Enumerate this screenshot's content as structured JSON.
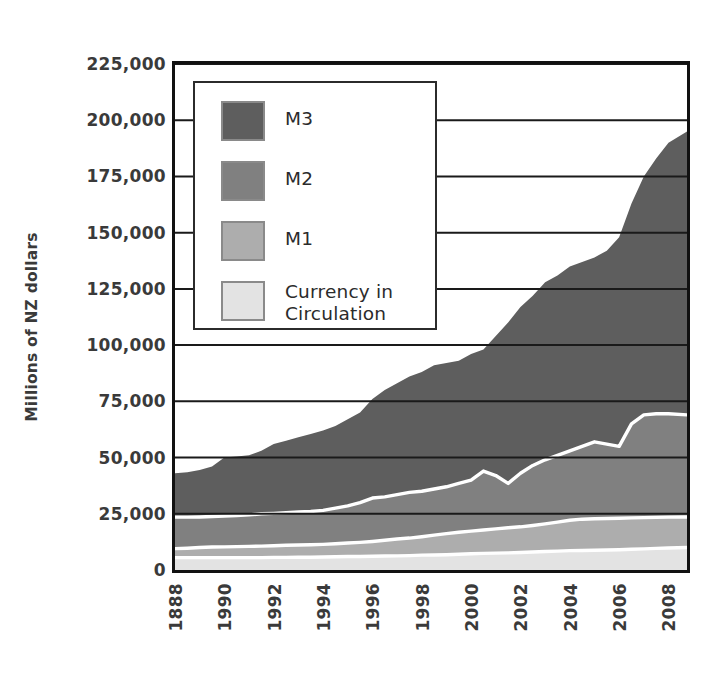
{
  "chart_data": {
    "type": "area",
    "title": "",
    "subtitle": "",
    "xlabel": "",
    "ylabel": "Millions of NZ dollars",
    "ylim": [
      0,
      225000
    ],
    "ytick_labels": [
      "225,000",
      "200,000",
      "175,000",
      "150,000",
      "125,000",
      "100,000",
      "75,000",
      "50,000",
      "25,000",
      "0"
    ],
    "ytick_values": [
      225000,
      200000,
      175000,
      150000,
      125000,
      100000,
      75000,
      50000,
      25000,
      0
    ],
    "ytick_step": 25000,
    "grid": true,
    "grid_axis": "y",
    "legend_position": "upper-left-inside",
    "stacking": "cumulative-overlay",
    "xtick_labels": [
      "1888",
      "1990",
      "1992",
      "1994",
      "1996",
      "1998",
      "2000",
      "2002",
      "2004",
      "2006",
      "2008"
    ],
    "xtick_values": [
      1988,
      1990,
      1992,
      1994,
      1996,
      1998,
      2000,
      2002,
      2004,
      2006,
      2008
    ],
    "x_range": [
      1988,
      2008.75
    ],
    "x_note": "First tick printed as 1888 in the source image; data begins 1988.",
    "series": [
      {
        "name": "M3",
        "color": "#5e5e5e",
        "x": [
          1988,
          1988.5,
          1989,
          1989.5,
          1990,
          1990.5,
          1991,
          1991.5,
          1992,
          1992.5,
          1993,
          1993.5,
          1994,
          1994.5,
          1995,
          1995.5,
          1996,
          1996.5,
          1997,
          1997.5,
          1998,
          1998.5,
          1999,
          1999.5,
          2000,
          2000.5,
          2001,
          2001.5,
          2002,
          2002.5,
          2003,
          2003.5,
          2004,
          2004.5,
          2005,
          2005.5,
          2006,
          2006.5,
          2007,
          2007.5,
          2008,
          2008.75
        ],
        "values": [
          43000,
          43500,
          44500,
          46000,
          50000,
          50500,
          51000,
          53000,
          56000,
          57500,
          59000,
          60500,
          62000,
          64000,
          67000,
          70000,
          76000,
          80000,
          83000,
          86000,
          88000,
          91000,
          92000,
          93000,
          96000,
          98000,
          104000,
          110000,
          117000,
          122000,
          128000,
          131000,
          135000,
          137000,
          139000,
          142000,
          148000,
          163000,
          175000,
          183000,
          190000,
          195000
        ]
      },
      {
        "name": "M2",
        "color": "#808080",
        "x": [
          1988,
          1988.5,
          1989,
          1989.5,
          1990,
          1990.5,
          1991,
          1991.5,
          1992,
          1992.5,
          1993,
          1993.5,
          1994,
          1994.5,
          1995,
          1995.5,
          1996,
          1996.5,
          1997,
          1997.5,
          1998,
          1998.5,
          1999,
          1999.5,
          2000,
          2000.5,
          2001,
          2001.5,
          2002,
          2002.5,
          2003,
          2003.5,
          2004,
          2004.5,
          2005,
          2005.5,
          2006,
          2006.5,
          2007,
          2007.5,
          2008,
          2008.75
        ],
        "values": [
          23500,
          23500,
          23600,
          23800,
          24000,
          24200,
          24500,
          25000,
          25200,
          25500,
          25800,
          26000,
          26500,
          27500,
          28500,
          30000,
          32000,
          32500,
          33500,
          34500,
          35000,
          36000,
          37000,
          38500,
          40000,
          44000,
          42000,
          38500,
          43000,
          46500,
          49000,
          51000,
          53000,
          55000,
          57000,
          56000,
          55000,
          65000,
          69000,
          69500,
          69500,
          69000
        ]
      },
      {
        "name": "M1",
        "color": "#adadad",
        "x": [
          1988,
          1988.5,
          1989,
          1989.5,
          1990,
          1990.5,
          1991,
          1991.5,
          1992,
          1992.5,
          1993,
          1993.5,
          1994,
          1994.5,
          1995,
          1995.5,
          1996,
          1996.5,
          1997,
          1997.5,
          1998,
          1998.5,
          1999,
          1999.5,
          2000,
          2000.5,
          2001,
          2001.5,
          2002,
          2002.5,
          2003,
          2003.5,
          2004,
          2004.5,
          2005,
          2005.5,
          2006,
          2006.5,
          2007,
          2007.5,
          2008,
          2008.75
        ],
        "values": [
          9500,
          9700,
          10000,
          10200,
          10300,
          10400,
          10500,
          10600,
          10800,
          11000,
          11100,
          11200,
          11400,
          11700,
          12000,
          12300,
          12700,
          13200,
          13800,
          14200,
          14800,
          15500,
          16200,
          16800,
          17300,
          17800,
          18300,
          18800,
          19200,
          19800,
          20500,
          21300,
          22100,
          22600,
          22800,
          22900,
          23000,
          23200,
          23300,
          23400,
          23500,
          23600
        ]
      },
      {
        "name": "Currency in Circulation",
        "color": "#e3e3e3",
        "x": [
          1988,
          1988.5,
          1989,
          1989.5,
          1990,
          1990.5,
          1991,
          1991.5,
          1992,
          1992.5,
          1993,
          1993.5,
          1994,
          1994.5,
          1995,
          1995.5,
          1996,
          1996.5,
          1997,
          1997.5,
          1998,
          1998.5,
          1999,
          1999.5,
          2000,
          2000.5,
          2001,
          2001.5,
          2002,
          2002.5,
          2003,
          2003.5,
          2004,
          2004.5,
          2005,
          2005.5,
          2006,
          2006.5,
          2007,
          2007.5,
          2008,
          2008.75
        ],
        "values": [
          5500,
          5500,
          5500,
          5500,
          5500,
          5500,
          5500,
          5500,
          5600,
          5600,
          5700,
          5700,
          5800,
          5900,
          6000,
          6000,
          6100,
          6200,
          6300,
          6400,
          6600,
          6700,
          6800,
          7000,
          7200,
          7400,
          7500,
          7600,
          7800,
          8000,
          8200,
          8400,
          8600,
          8700,
          8800,
          8900,
          9000,
          9200,
          9400,
          9600,
          9800,
          10000
        ]
      }
    ]
  },
  "legend": {
    "items": [
      {
        "label": "M3",
        "color": "#5e5e5e",
        "lines": [
          "M3"
        ]
      },
      {
        "label": "M2",
        "color": "#808080",
        "lines": [
          "M2"
        ]
      },
      {
        "label": "M1",
        "color": "#adadad",
        "lines": [
          "M1"
        ]
      },
      {
        "label": "Currency in Circulation",
        "color": "#e3e3e3",
        "lines": [
          "Currency in",
          "Circulation"
        ]
      }
    ]
  },
  "style": {
    "axis_color": "#111111",
    "grid_color": "#1a1a1a",
    "separator_color": "#ffffff",
    "text_color": "#3a3a3a",
    "background": "#ffffff"
  }
}
